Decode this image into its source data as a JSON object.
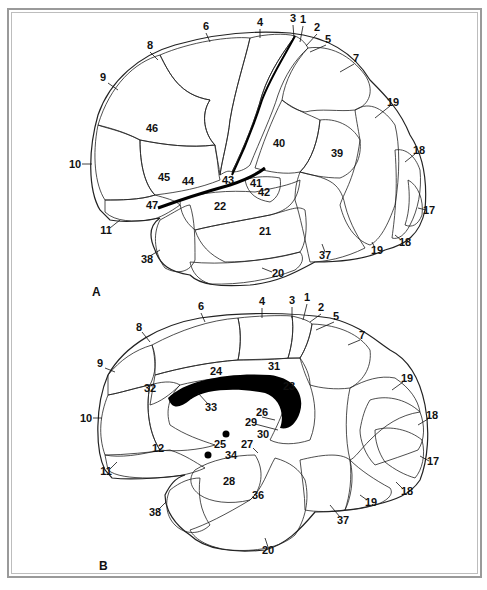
{
  "figure": {
    "type": "Brodmann cytoarchitectonic areas of the cerebral cortex",
    "panels": [
      {
        "id": "A",
        "label": "A",
        "view": "lateral",
        "areas": [
          {
            "n": "1",
            "x": 303,
            "y": 23
          },
          {
            "n": "2",
            "x": 317,
            "y": 31
          },
          {
            "n": "3",
            "x": 293,
            "y": 22
          },
          {
            "n": "4",
            "x": 260,
            "y": 26
          },
          {
            "n": "5",
            "x": 328,
            "y": 43
          },
          {
            "n": "6",
            "x": 206,
            "y": 30
          },
          {
            "n": "7",
            "x": 354,
            "y": 61
          },
          {
            "n": "8",
            "x": 150,
            "y": 49
          },
          {
            "n": "9",
            "x": 103,
            "y": 81
          },
          {
            "n": "10",
            "x": 75,
            "y": 166
          },
          {
            "n": "11",
            "x": 106,
            "y": 232
          },
          {
            "n": "17",
            "x": 429,
            "y": 212
          },
          {
            "n": "18",
            "x": 419,
            "y": 152
          },
          {
            "n": "18b",
            "display": "18",
            "x": 405,
            "y": 244
          },
          {
            "n": "19",
            "x": 393,
            "y": 104
          },
          {
            "n": "19b",
            "display": "19",
            "x": 377,
            "y": 252
          },
          {
            "n": "20",
            "x": 276,
            "y": 275
          },
          {
            "n": "21",
            "x": 265,
            "y": 233
          },
          {
            "n": "22",
            "x": 220,
            "y": 208
          },
          {
            "n": "37",
            "x": 325,
            "y": 257
          },
          {
            "n": "38",
            "x": 147,
            "y": 261
          },
          {
            "n": "39",
            "x": 337,
            "y": 155
          },
          {
            "n": "40",
            "x": 279,
            "y": 145
          },
          {
            "n": "41",
            "x": 256,
            "y": 185
          },
          {
            "n": "42",
            "x": 264,
            "y": 194
          },
          {
            "n": "43",
            "x": 228,
            "y": 182
          },
          {
            "n": "44",
            "x": 188,
            "y": 183
          },
          {
            "n": "45",
            "x": 164,
            "y": 179
          },
          {
            "n": "46",
            "x": 152,
            "y": 130
          },
          {
            "n": "47",
            "x": 152,
            "y": 207
          }
        ]
      },
      {
        "id": "B",
        "label": "B",
        "view": "medial",
        "areas": [
          {
            "n": "1",
            "x": 307,
            "y": 301
          },
          {
            "n": "2",
            "x": 321,
            "y": 311
          },
          {
            "n": "3",
            "x": 292,
            "y": 304
          },
          {
            "n": "4",
            "x": 262,
            "y": 305
          },
          {
            "n": "5",
            "x": 336,
            "y": 319
          },
          {
            "n": "6",
            "x": 201,
            "y": 310
          },
          {
            "n": "7",
            "x": 362,
            "y": 337
          },
          {
            "n": "8",
            "x": 139,
            "y": 329
          },
          {
            "n": "9",
            "x": 100,
            "y": 365
          },
          {
            "n": "10",
            "x": 86,
            "y": 420
          },
          {
            "n": "11",
            "x": 106,
            "y": 473
          },
          {
            "n": "12",
            "x": 158,
            "y": 450
          },
          {
            "n": "17",
            "x": 433,
            "y": 463
          },
          {
            "n": "18",
            "x": 432,
            "y": 417
          },
          {
            "n": "18b",
            "display": "18",
            "x": 407,
            "y": 493
          },
          {
            "n": "19",
            "x": 407,
            "y": 380
          },
          {
            "n": "19b",
            "display": "19",
            "x": 371,
            "y": 504
          },
          {
            "n": "20",
            "x": 268,
            "y": 552
          },
          {
            "n": "23",
            "x": 289,
            "y": 388
          },
          {
            "n": "24",
            "x": 216,
            "y": 373
          },
          {
            "n": "25",
            "x": 220,
            "y": 446
          },
          {
            "n": "26",
            "x": 262,
            "y": 414
          },
          {
            "n": "27",
            "x": 247,
            "y": 446
          },
          {
            "n": "28",
            "x": 229,
            "y": 483
          },
          {
            "n": "29",
            "x": 251,
            "y": 424
          },
          {
            "n": "30",
            "x": 263,
            "y": 436
          },
          {
            "n": "31",
            "x": 274,
            "y": 368
          },
          {
            "n": "32",
            "x": 150,
            "y": 390
          },
          {
            "n": "33",
            "x": 211,
            "y": 409
          },
          {
            "n": "34",
            "x": 231,
            "y": 457
          },
          {
            "n": "36",
            "x": 258,
            "y": 497
          },
          {
            "n": "37",
            "x": 343,
            "y": 522
          },
          {
            "n": "38",
            "x": 155,
            "y": 514
          }
        ]
      }
    ],
    "colors": {
      "ink": "#111111",
      "frame": "#9a9a9a",
      "background": "#ffffff",
      "dense_fill": "#000000",
      "stipple": "#888888"
    }
  }
}
